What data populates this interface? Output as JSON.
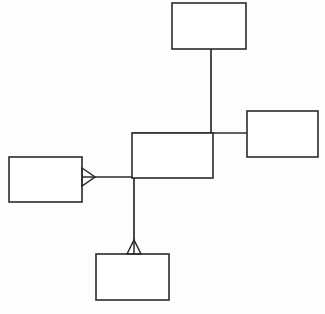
{
  "diagram": {
    "type": "er-diagram",
    "canvas": {
      "width": 325,
      "height": 314,
      "background_color": "#fdfdfd"
    },
    "style": {
      "line_color": "#2b2b2b",
      "box_fill": "#ffffff",
      "box_stroke": "#2b2b2b",
      "line_width": 1.7
    },
    "nodes": [
      {
        "id": "node-top",
        "label": "",
        "shape": "rectangle",
        "x": 172,
        "y": 3,
        "width": 74,
        "height": 46
      },
      {
        "id": "node-right",
        "label": "",
        "shape": "rectangle",
        "x": 247,
        "y": 111,
        "width": 71,
        "height": 46
      },
      {
        "id": "node-center",
        "label": "",
        "shape": "rectangle",
        "x": 132,
        "y": 133,
        "width": 81,
        "height": 45
      },
      {
        "id": "node-left",
        "label": "",
        "shape": "rectangle",
        "x": 9,
        "y": 157,
        "width": 73,
        "height": 45
      },
      {
        "id": "node-bottom",
        "label": "",
        "shape": "rectangle",
        "x": 96,
        "y": 254,
        "width": 73,
        "height": 46
      }
    ],
    "edges": [
      {
        "id": "edge-top-to-center",
        "from": "node-top",
        "to": "node-center",
        "label": "",
        "path": "M 211 49 L 211 178",
        "marker_start": "none",
        "marker_end": "none"
      },
      {
        "id": "edge-center-to-right",
        "from": "node-center",
        "to": "node-right",
        "label": "",
        "path": "M 132 133 L 247 133",
        "marker_start": "none",
        "marker_end": "none"
      },
      {
        "id": "edge-left-to-center",
        "from": "node-left",
        "to": "node-center",
        "label": "",
        "path": "M 95 177 L 213 177",
        "marker_start": "crowfoot",
        "marker_end": "none"
      },
      {
        "id": "edge-center-to-bottom",
        "from": "node-center",
        "to": "node-bottom",
        "label": "",
        "path": "M 134 133 L 134 240",
        "marker_start": "none",
        "marker_end": "crowfoot"
      }
    ],
    "markers": [
      {
        "id": "crowfoot-left",
        "for_edge": "edge-left-to-center",
        "direction": "right",
        "tip_x": 95,
        "tip_y": 177,
        "base_x": 82,
        "base_y": 177
      },
      {
        "id": "crowfoot-bottom",
        "for_edge": "edge-center-to-bottom",
        "direction": "down",
        "tip_x": 134,
        "tip_y": 240,
        "base_x": 134,
        "base_y": 254
      }
    ]
  }
}
